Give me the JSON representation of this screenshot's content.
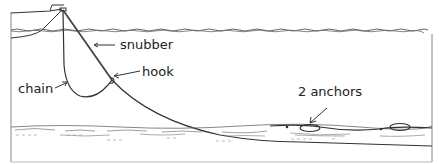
{
  "diagram": {
    "type": "anchoring-setup-illustration",
    "labels": {
      "snubber": "snubber",
      "hook": "hook",
      "chain": "chain",
      "anchors": "2 anchors"
    },
    "elements": [
      "boat",
      "water-surface",
      "snubber-line",
      "chain",
      "hook",
      "seabed",
      "anchor-1",
      "anchor-2"
    ],
    "colors": {
      "line": "#333333",
      "water": "#555555",
      "seabed": "#666666",
      "frame": "#888888",
      "background": "#ffffff"
    }
  }
}
